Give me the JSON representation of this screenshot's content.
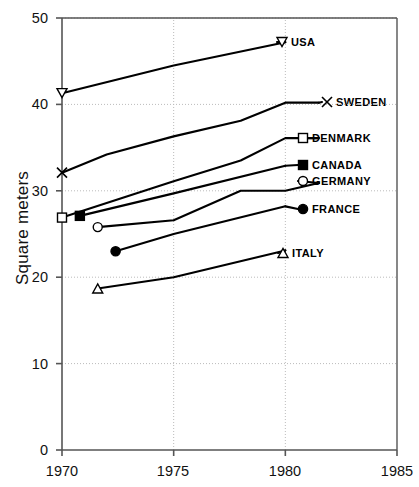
{
  "chart_data": {
    "type": "line",
    "title": "",
    "xlabel": "",
    "ylabel": "Square meters",
    "xlim": [
      1970,
      1985
    ],
    "ylim": [
      0,
      50
    ],
    "xticks": [
      1970,
      1975,
      1980,
      1985
    ],
    "yticks": [
      0,
      10,
      20,
      30,
      40,
      50
    ],
    "grid": "dotted gridlines at y = 10, 20, 30, 40 and x = 1975, 1980",
    "legend_position": "inline right-side labels at end of each line",
    "series": [
      {
        "name": "USA",
        "marker": "down-triangle-open",
        "x": [
          1970,
          1975,
          1980
        ],
        "y": [
          41.3,
          44.5,
          47.2
        ]
      },
      {
        "name": "SWEDEN",
        "marker": "x-cross",
        "x": [
          1970,
          1972,
          1975,
          1978,
          1980,
          1981.5
        ],
        "y": [
          32.1,
          34.2,
          36.3,
          38.1,
          40.2,
          40.2
        ]
      },
      {
        "name": "DENMARK",
        "marker": "square-open",
        "x": [
          1970,
          1975,
          1978,
          1980,
          1981.5
        ],
        "y": [
          26.9,
          31.1,
          33.5,
          36.1,
          36.1
        ]
      },
      {
        "name": "CANADA",
        "marker": "square-filled",
        "x": [
          1970.8,
          1975,
          1980
        ],
        "y": [
          27.1,
          29.7,
          32.9
        ]
      },
      {
        "name": "GERMANY",
        "marker": "circle-open",
        "x": [
          1971.6,
          1975,
          1978,
          1980,
          1981.5
        ],
        "y": [
          25.8,
          26.6,
          30.0,
          30.0,
          30.9
        ]
      },
      {
        "name": "FRANCE",
        "marker": "circle-filled",
        "x": [
          1972.4,
          1975,
          1980
        ],
        "y": [
          23.0,
          25.0,
          28.2
        ]
      },
      {
        "name": "ITALY",
        "marker": "up-triangle-open",
        "x": [
          1971.6,
          1975,
          1980
        ],
        "y": [
          18.7,
          20.0,
          23.1
        ]
      }
    ]
  },
  "axes": {
    "y_title": "Square meters",
    "x_tick_labels": [
      "1970",
      "1975",
      "1980",
      "1985"
    ],
    "y_tick_labels": [
      "0",
      "10",
      "20",
      "30",
      "40",
      "50"
    ]
  },
  "series_labels": {
    "usa": "USA",
    "sweden": "SWEDEN",
    "denmark": "DENMARK",
    "canada": "CANADA",
    "germany": "GERMANY",
    "france": "FRANCE",
    "italy": "ITALY"
  },
  "colors": {
    "line": "#000000",
    "axis": "#555555",
    "grid": "#bbbbbb",
    "background": "#ffffff"
  }
}
